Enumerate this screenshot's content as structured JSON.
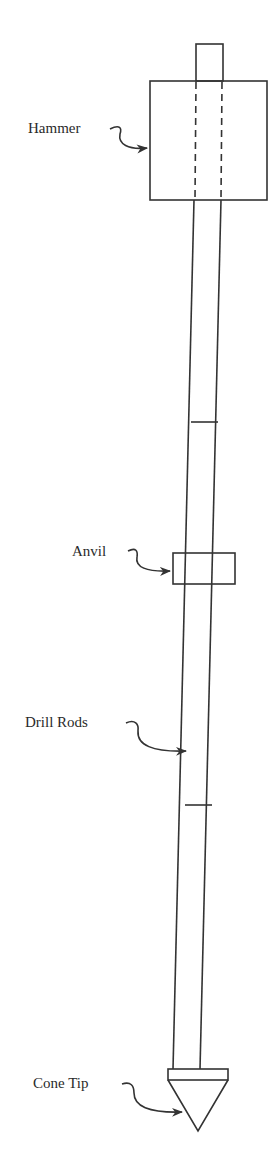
{
  "diagram": {
    "type": "Standard Penetration / Dynamic Cone Test apparatus",
    "labels": {
      "hammer": "Hammer",
      "anvil": "Anvil",
      "drill_rods": "Drill Rods",
      "cone_tip": "Cone Tip"
    },
    "colors": {
      "line": "#333333",
      "text": "#2a2a2a",
      "background": "#ffffff"
    }
  }
}
